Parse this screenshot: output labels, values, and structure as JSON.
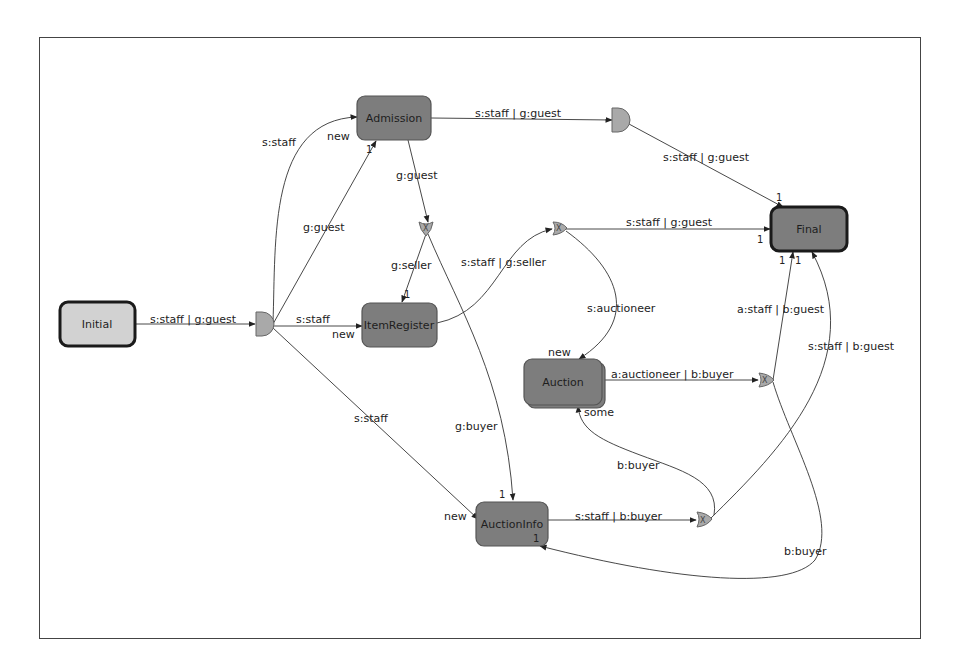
{
  "diagram": {
    "frame": {
      "x": 39,
      "y": 37,
      "w": 882,
      "h": 602
    },
    "colors": {
      "node_fill": "#7d7d7d",
      "initial_fill": "#d2d2d2",
      "gate_fill": "#a9a9a9",
      "edge": "#333333"
    },
    "nodes": [
      {
        "id": "initial",
        "label": "Initial",
        "x": 60,
        "y": 302,
        "w": 75,
        "h": 44,
        "kind": "initial"
      },
      {
        "id": "admission",
        "label": "Admission",
        "x": 357,
        "y": 96,
        "w": 74,
        "h": 44,
        "kind": "state"
      },
      {
        "id": "itemregister",
        "label": "ItemRegister",
        "x": 362,
        "y": 303,
        "w": 75,
        "h": 44,
        "kind": "state"
      },
      {
        "id": "auction",
        "label": "Auction",
        "x": 524,
        "y": 359,
        "w": 78,
        "h": 46,
        "kind": "state"
      },
      {
        "id": "auctioninfo",
        "label": "AuctionInfo",
        "x": 476,
        "y": 502,
        "w": 72,
        "h": 44,
        "kind": "state"
      },
      {
        "id": "final",
        "label": "Final",
        "x": 771,
        "y": 207,
        "w": 76,
        "h": 44,
        "kind": "final"
      }
    ],
    "gates": [
      {
        "id": "and1",
        "type": "and",
        "x": 263,
        "y": 324
      },
      {
        "id": "and2",
        "type": "and",
        "x": 619,
        "y": 120
      },
      {
        "id": "xor1",
        "type": "xor",
        "x": 426,
        "y": 228,
        "symbol": "X"
      },
      {
        "id": "xor2",
        "type": "xor",
        "x": 559,
        "y": 228,
        "symbol": "X"
      },
      {
        "id": "xor3",
        "type": "xor",
        "x": 766,
        "y": 380,
        "symbol": "X"
      },
      {
        "id": "xor4",
        "type": "xor",
        "x": 703,
        "y": 519,
        "symbol": "X"
      }
    ],
    "edges": [
      {
        "id": "e1",
        "label": "s:staff | g:guest",
        "lx": 150,
        "ly": 323
      },
      {
        "id": "e2",
        "label": "s:staff",
        "lx": 262,
        "ly": 146
      },
      {
        "id": "e3",
        "label": "g:guest",
        "lx": 303,
        "ly": 231
      },
      {
        "id": "e4",
        "label": "s:staff",
        "lx": 296,
        "ly": 323
      },
      {
        "id": "e5",
        "label": "s:staff",
        "lx": 354,
        "ly": 422
      },
      {
        "id": "e6",
        "label": "s:staff | g:guest",
        "lx": 475,
        "ly": 117
      },
      {
        "id": "e7",
        "label": "g:guest",
        "lx": 396,
        "ly": 179
      },
      {
        "id": "e8",
        "label": "g:seller",
        "lx": 391,
        "ly": 269
      },
      {
        "id": "e9",
        "label": "g:buyer",
        "lx": 455,
        "ly": 430
      },
      {
        "id": "e10",
        "label": "s:staff | g:seller",
        "lx": 461,
        "ly": 266
      },
      {
        "id": "e11",
        "label": "s:staff | g:guest",
        "lx": 663,
        "ly": 161
      },
      {
        "id": "e12",
        "label": "s:staff | g:guest",
        "lx": 626,
        "ly": 226
      },
      {
        "id": "e13",
        "label": "s:auctioneer",
        "lx": 587,
        "ly": 312
      },
      {
        "id": "e14",
        "label": "a:auctioneer | b:buyer",
        "lx": 611,
        "ly": 378
      },
      {
        "id": "e15",
        "label": "a:staff | b:guest",
        "lx": 737,
        "ly": 313
      },
      {
        "id": "e16",
        "label": "s:staff | b:guest",
        "lx": 808,
        "ly": 350
      },
      {
        "id": "e17",
        "label": "b:buyer",
        "lx": 617,
        "ly": 469
      },
      {
        "id": "e18",
        "label": "s:staff | b:buyer",
        "lx": 575,
        "ly": 520
      },
      {
        "id": "e19",
        "label": "b:buyer",
        "lx": 784,
        "ly": 555
      }
    ],
    "annotations": [
      {
        "text": "new",
        "x": 327,
        "y": 140
      },
      {
        "text": "1",
        "x": 366,
        "y": 153
      },
      {
        "text": "new",
        "x": 332,
        "y": 338
      },
      {
        "text": "1",
        "x": 404,
        "y": 298
      },
      {
        "text": "new",
        "x": 548,
        "y": 356
      },
      {
        "text": "some",
        "x": 584,
        "y": 416
      },
      {
        "text": "new",
        "x": 444,
        "y": 520
      },
      {
        "text": "1",
        "x": 499,
        "y": 498
      },
      {
        "text": "1",
        "x": 533,
        "y": 542
      },
      {
        "text": "1",
        "x": 776,
        "y": 201
      },
      {
        "text": "1",
        "x": 757,
        "y": 243
      },
      {
        "text": "1",
        "x": 779,
        "y": 264
      },
      {
        "text": "1",
        "x": 795,
        "y": 264
      }
    ]
  }
}
